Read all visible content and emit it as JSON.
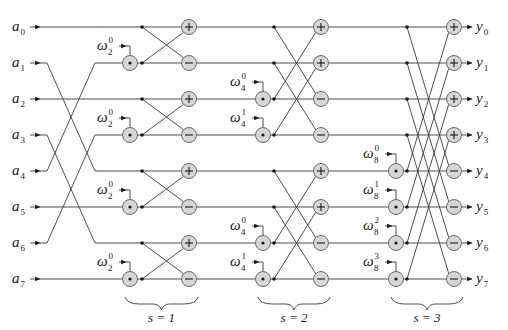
{
  "diagram": {
    "type": "fft-butterfly-network",
    "n": 8,
    "inputs": [
      {
        "base": "a",
        "index": "0"
      },
      {
        "base": "a",
        "index": "1"
      },
      {
        "base": "a",
        "index": "2"
      },
      {
        "base": "a",
        "index": "3"
      },
      {
        "base": "a",
        "index": "4"
      },
      {
        "base": "a",
        "index": "5"
      },
      {
        "base": "a",
        "index": "6"
      },
      {
        "base": "a",
        "index": "7"
      }
    ],
    "outputs": [
      {
        "base": "y",
        "index": "0"
      },
      {
        "base": "y",
        "index": "1"
      },
      {
        "base": "y",
        "index": "2"
      },
      {
        "base": "y",
        "index": "3"
      },
      {
        "base": "y",
        "index": "4"
      },
      {
        "base": "y",
        "index": "5"
      },
      {
        "base": "y",
        "index": "6"
      },
      {
        "base": "y",
        "index": "7"
      }
    ],
    "bit_reversal_permutation": [
      0,
      4,
      2,
      6,
      1,
      5,
      3,
      7
    ],
    "stages": [
      {
        "label": "s = 1",
        "twiddles": [
          {
            "base": "ω",
            "sub": "2",
            "sup": "0",
            "row": 1
          },
          {
            "base": "ω",
            "sub": "2",
            "sup": "0",
            "row": 3
          },
          {
            "base": "ω",
            "sub": "2",
            "sup": "0",
            "row": 5
          },
          {
            "base": "ω",
            "sub": "2",
            "sup": "0",
            "row": 7
          }
        ],
        "ops": [
          "+",
          "−",
          "+",
          "−",
          "+",
          "−",
          "+",
          "−"
        ]
      },
      {
        "label": "s = 2",
        "twiddles": [
          {
            "base": "ω",
            "sub": "4",
            "sup": "0",
            "row": 2
          },
          {
            "base": "ω",
            "sub": "4",
            "sup": "1",
            "row": 3
          },
          {
            "base": "ω",
            "sub": "4",
            "sup": "0",
            "row": 6
          },
          {
            "base": "ω",
            "sub": "4",
            "sup": "1",
            "row": 7
          }
        ],
        "ops": [
          "+",
          "+",
          "−",
          "−",
          "+",
          "+",
          "−",
          "−"
        ]
      },
      {
        "label": "s = 3",
        "twiddles": [
          {
            "base": "ω",
            "sub": "8",
            "sup": "0",
            "row": 4
          },
          {
            "base": "ω",
            "sub": "8",
            "sup": "1",
            "row": 5
          },
          {
            "base": "ω",
            "sub": "8",
            "sup": "2",
            "row": 6
          },
          {
            "base": "ω",
            "sub": "8",
            "sup": "3",
            "row": 7
          }
        ],
        "ops": [
          "+",
          "+",
          "+",
          "+",
          "−",
          "−",
          "−",
          "−"
        ]
      }
    ],
    "colors": {
      "wire": "#3a3a3a",
      "node_fill": "#d6d6d6",
      "node_stroke": "#6a6a6a",
      "background": "#ffffff"
    }
  }
}
